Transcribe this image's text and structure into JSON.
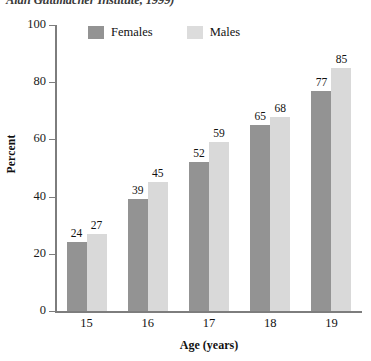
{
  "caption": "Alan Guttmacher Institute, 1999)",
  "legend": {
    "position": "top-left-inside",
    "items": [
      {
        "label": "Females",
        "color": "#939393",
        "icon": "legend-swatch-icon"
      },
      {
        "label": "Males",
        "color": "#d9d9d9",
        "icon": "legend-swatch-icon"
      }
    ]
  },
  "chart_data": {
    "type": "bar",
    "title": "",
    "subtitle": "",
    "categories": [
      "15",
      "16",
      "17",
      "18",
      "19"
    ],
    "series": [
      {
        "name": "Females",
        "color": "#939393",
        "values": [
          24,
          39,
          52,
          65,
          77
        ]
      },
      {
        "name": "Males",
        "color": "#d9d9d9",
        "values": [
          27,
          45,
          59,
          68,
          85
        ]
      }
    ],
    "xlabel": "Age (years)",
    "ylabel": "Percent",
    "ylim": [
      0,
      100
    ],
    "yticks": [
      0,
      20,
      40,
      60,
      80,
      100
    ],
    "ytick_labels": [
      "0",
      "20",
      "40",
      "60",
      "80",
      "100"
    ],
    "xtick_labels": [
      "15",
      "16",
      "17",
      "18",
      "19"
    ],
    "grid": false,
    "data_labels": true,
    "legend_position": "upper left"
  }
}
